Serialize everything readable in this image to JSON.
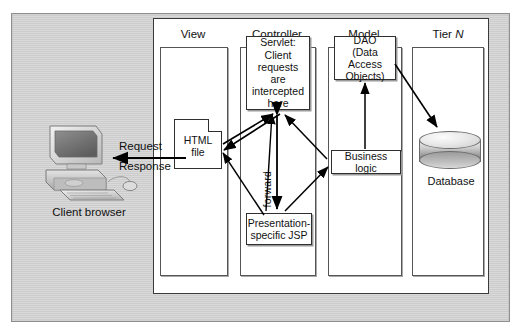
{
  "diagram": {
    "client": {
      "icon": "desktop-computer-icon",
      "caption": "Client browser"
    },
    "flows": [
      {
        "id": "request",
        "label": "Request"
      },
      {
        "id": "response",
        "label": "Response"
      }
    ],
    "columns": [
      {
        "id": "view",
        "header": "View",
        "header_italic": false,
        "nodes": [
          {
            "id": "html-file",
            "label": "HTML\nfile",
            "shape": "document"
          }
        ]
      },
      {
        "id": "controller",
        "header": "Controller",
        "header_italic": false,
        "nodes": [
          {
            "id": "servlet",
            "label": "Servlet:\nClient\nrequests are\nintercepted\nhere",
            "shape": "rect"
          },
          {
            "id": "jsp",
            "label": "Presentation-\nspecific JSP",
            "shape": "rect"
          }
        ]
      },
      {
        "id": "model",
        "header": "Model",
        "header_italic": false,
        "nodes": [
          {
            "id": "dao",
            "label": "DAO\n(Data Access\nObjects)",
            "shape": "rect"
          },
          {
            "id": "business-logic",
            "label": "Business logic",
            "shape": "rect"
          }
        ]
      },
      {
        "id": "tier-n",
        "header": "Tier N",
        "header_prefix": "Tier ",
        "header_italic_part": "N",
        "header_italic": true,
        "nodes": [
          {
            "id": "database",
            "label": "Database",
            "shape": "cylinder"
          }
        ]
      }
    ],
    "edge_labels": [
      {
        "id": "forward",
        "label": "forward",
        "orientation": "vertical"
      }
    ],
    "colors": {
      "canvas_background": "#cfcfcf",
      "panel_background": "#ffffff",
      "node_border": "#2f2f2f",
      "node_shadow": "#9a9a9a",
      "arrow": "#000000",
      "text": "#111111",
      "database_fill": "#cdcdcd"
    }
  }
}
